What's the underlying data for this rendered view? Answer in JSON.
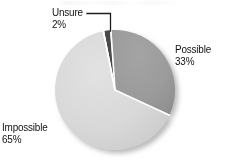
{
  "chart_data": {
    "type": "pie",
    "title": "",
    "categories": [
      "Possible",
      "Impossible",
      "Unsure"
    ],
    "values": [
      33,
      65,
      2
    ],
    "value_suffix": "%",
    "labels": [
      {
        "name": "Possible",
        "value": 33,
        "value_text": "33%",
        "color": "#9b9b9b",
        "position": "right"
      },
      {
        "name": "Impossible",
        "value": 65,
        "value_text": "65%",
        "color": "#d8d8d8",
        "position": "bottom-left"
      },
      {
        "name": "Unsure",
        "value": 2,
        "value_text": "2%",
        "color": "#4a4a4a",
        "position": "top-left",
        "leader_line": true
      }
    ],
    "legend": "none",
    "grid": false,
    "start_angle_deg": -4,
    "direction": "clockwise",
    "slice_separator_color": "#ffffff",
    "background": "#ffffff"
  },
  "geometry": {
    "center_x": 115,
    "center_y": 90,
    "radius": 60,
    "shadow": true
  },
  "slices": {
    "possible": {
      "label": "Possible",
      "percent_text": "33%"
    },
    "impossible": {
      "label": "Impossible",
      "percent_text": "65%"
    },
    "unsure": {
      "label": "Unsure",
      "percent_text": "2%"
    }
  },
  "colors": {
    "possible": "#9b9b9b",
    "impossible": "#d8d8d8",
    "unsure": "#4a4a4a",
    "separator": "#ffffff",
    "text": "#111111",
    "leader_line": "#1d1d1d",
    "background": "#ffffff"
  }
}
